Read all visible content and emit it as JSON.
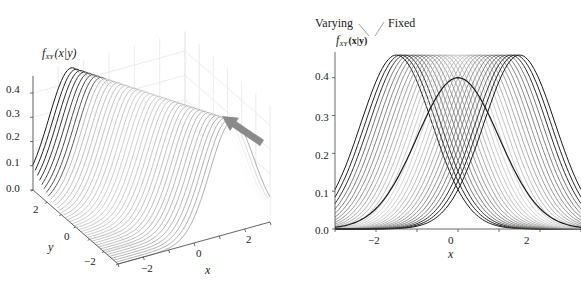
{
  "chart_data": [
    {
      "type": "surface3d",
      "title": "",
      "zlabel": "f_XY (x|y)",
      "zlabel_main": "f",
      "zlabel_sub": "XY",
      "zlabel_args": "(x|y)",
      "xlabel": "x",
      "ylabel": "y",
      "xlim": [
        -3,
        3
      ],
      "ylim": [
        -3,
        3
      ],
      "zlim": [
        0,
        0.45
      ],
      "xticks": [
        -2,
        0,
        2
      ],
      "yticks": [
        2,
        0,
        -2
      ],
      "zticks": [
        0.0,
        0.1,
        0.2,
        0.3,
        0.4
      ],
      "zticklabels": [
        "0.0",
        "0.1",
        "0.2",
        "0.3",
        "0.4"
      ],
      "xticklabels": [
        "−2",
        "0",
        "2"
      ],
      "yticklabels": [
        "2",
        "0",
        "−2"
      ],
      "description": "Family of conditional Gaussian PDF slices f(x|y) plotted along the y axis; mean shifts with y, peak ~0.46, dark highlighted slices at extremes",
      "n_slices": 40,
      "sigma": 0.87,
      "peak": 0.46,
      "arrow": {
        "direction": "view projection toward right panel",
        "color": "#8a8a8a"
      }
    },
    {
      "type": "line",
      "title": "",
      "ylabel": "f_XY (x|y)",
      "xlabel": "x",
      "xlim": [
        -3,
        3
      ],
      "ylim": [
        0,
        0.46
      ],
      "xticks": [
        -2,
        0,
        2
      ],
      "xticklabels": [
        "−2",
        "0",
        "2"
      ],
      "yticks": [
        0.0,
        0.1,
        0.2,
        0.3,
        0.4
      ],
      "yticklabels": [
        "0.0",
        "0.1",
        "0.2",
        "0.3",
        "0.4"
      ],
      "annotations": [
        "Varying",
        "Fixed"
      ],
      "series": [
        {
          "name": "conditional slices (shifted means)",
          "mean_range": [
            -1.5,
            1.5
          ],
          "sigma": 0.87,
          "peak": 0.46,
          "count": 30
        },
        {
          "name": "marginal / reference",
          "mean": 0,
          "sigma": 1.0,
          "peak": 0.4
        }
      ]
    }
  ],
  "left": {
    "zlabel_f": "f",
    "zlabel_sub": "XY",
    "zlabel_args": "(x|y)",
    "zticks": [
      "0.0",
      "0.1",
      "0.2",
      "0.3",
      "0.4"
    ],
    "xticks": [
      "−2",
      "0",
      "2"
    ],
    "yticks": [
      "2",
      "0",
      "−2"
    ],
    "xlabel": "x",
    "ylabel": "y"
  },
  "right": {
    "ann_varying": "Varying",
    "ann_fixed": "Fixed",
    "ylabel_f": "f",
    "ylabel_sub": "XY",
    "ylabel_args": "(x|y)",
    "yticks": [
      "0.0",
      "0.1",
      "0.2",
      "0.3",
      "0.4"
    ],
    "xticks": [
      "−2",
      "0",
      "2"
    ],
    "xlabel": "x"
  },
  "colors": {
    "curve_dark": "#1a1a1a",
    "curve_light": "#bdbdbd",
    "grid": "#e6e6e6",
    "axis": "#444444",
    "arrow": "#8c8c8c"
  }
}
